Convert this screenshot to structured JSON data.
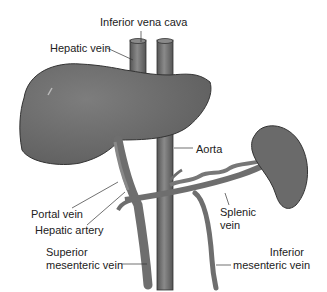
{
  "diagram": {
    "labels": {
      "inferior_vena_cava": "Inferior vena cava",
      "hepatic_vein": "Hepatic vein",
      "aorta": "Aorta",
      "portal_vein": "Portal vein",
      "hepatic_artery": "Hepatic artery",
      "splenic_vein_1": "Splenic",
      "splenic_vein_2": "vein",
      "superior_mesenteric_1": "Superior",
      "superior_mesenteric_2": "mesenteric vein",
      "inferior_mesenteric_1": "Inferior",
      "inferior_mesenteric_2": "mesenteric vein"
    },
    "structures": [
      "liver",
      "spleen",
      "inferior vena cava",
      "aorta",
      "portal vein",
      "hepatic artery",
      "splenic vein",
      "superior mesenteric vein",
      "inferior mesenteric vein"
    ],
    "colors": {
      "organ": "#6e6e6e",
      "vessel": "#777777",
      "outline": "#333333",
      "text": "#222222"
    }
  }
}
